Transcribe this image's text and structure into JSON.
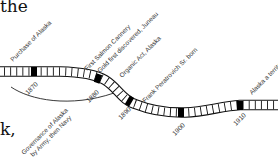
{
  "text_fragments": {
    "top": "the",
    "bottom": "k,"
  },
  "timeline": {
    "years": [
      "1870",
      "1880",
      "1890",
      "1900",
      "1910"
    ],
    "events": [
      {
        "label": "Purchase of Alaska"
      },
      {
        "label": "First Salmon Cannery"
      },
      {
        "label": "Gold first discovered, Juneau"
      },
      {
        "label": "Organic Act, Alaska"
      },
      {
        "label": "Frank Peratrovich Sr. born"
      },
      {
        "label": "Alaska a territory"
      }
    ],
    "span_label": {
      "line1": "Governance of Alaska",
      "line2": "by Army, then Navy"
    },
    "colors": {
      "ribbon_stroke": "#111111",
      "decade_marker": "#000000",
      "background": "#ffffff"
    }
  }
}
